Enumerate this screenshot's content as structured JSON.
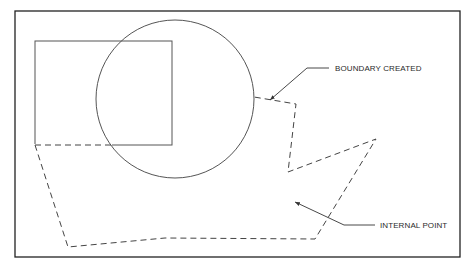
{
  "diagram": {
    "kind": "boundary-creation-illustration",
    "colors": {
      "background": "#ffffff",
      "frame": "#222222",
      "shapes": "#555555",
      "boundary": "#444444",
      "text": "#2a2a2a"
    },
    "frame": {
      "x": 15,
      "y": 11,
      "width": 445,
      "height": 246
    },
    "rectangle": {
      "x": 35,
      "y": 41,
      "width": 137,
      "height": 104
    },
    "circle": {
      "cx": 175,
      "cy": 99,
      "r": 79
    },
    "boundary_path": [
      [
        35,
        145
      ],
      [
        112,
        145
      ],
      [
        35,
        145
      ],
      [
        68,
        247
      ],
      [
        165,
        238
      ],
      [
        315,
        239
      ],
      [
        376,
        139
      ],
      [
        288,
        172
      ],
      [
        296,
        104
      ],
      [
        254,
        97
      ]
    ],
    "labels": {
      "boundary_created": "BOUNDARY CREATED",
      "internal_point": "INTERNAL POINT"
    },
    "leaders": {
      "boundary_created": {
        "tip": [
          270,
          100
        ],
        "elbow": [
          307,
          68
        ],
        "end": [
          329,
          68
        ]
      },
      "internal_point": {
        "tip": [
          295,
          202
        ],
        "elbow": [
          344,
          225
        ],
        "end": [
          375,
          225
        ]
      }
    }
  }
}
